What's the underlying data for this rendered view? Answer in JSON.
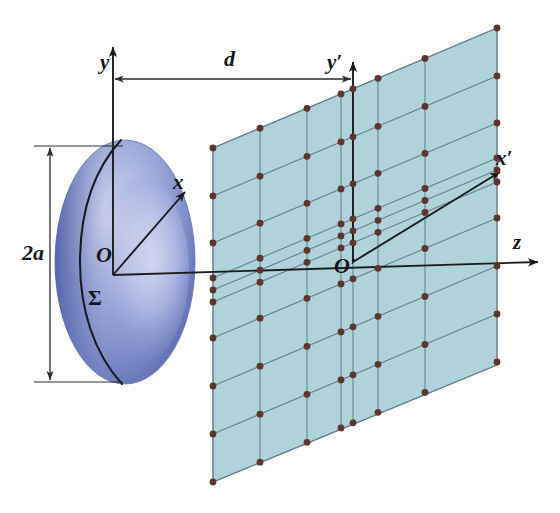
{
  "figure": {
    "background_color": "#fdfdfd"
  },
  "colors": {
    "plane_fill": "#a9ced6",
    "plane_edge": "#5f7f8a",
    "grid_line": "#6e8d96",
    "dot": "#5e3330",
    "axis": "#1b1c20",
    "sphere_dark": "#5c6cae",
    "sphere_mid": "#8e9ad2",
    "sphere_light": "#d6dcf0",
    "sphere_rim": "#4a5aa0",
    "label": "#15161a",
    "dimension_line": "#2a2c31"
  },
  "labels": {
    "y_axis": "y",
    "y_prime_axis": "y′",
    "x_axis": "x",
    "x_prime_axis": "x′",
    "z_axis": "z",
    "origin": "O",
    "origin_prime": "O′",
    "sphere_surface": "Σ",
    "diameter": "2a",
    "distance": "d"
  },
  "geometry": {
    "sphere": {
      "center_x": 125,
      "center_y": 262,
      "radius_x": 70,
      "radius_y": 122,
      "label_O_x": 104,
      "label_O_y": 252,
      "label_sigma_x": 97,
      "label_sigma_y": 296
    },
    "origin": {
      "x": 113,
      "y": 275
    },
    "origin_prime": {
      "x": 353,
      "y": 262
    },
    "plane": {
      "left_x": 213,
      "right_x": 497,
      "top_left_y": 148,
      "top_right_y": 28,
      "bottom_left_y": 482,
      "bottom_right_y": 365,
      "columns": 7,
      "rows": 8,
      "dot_radius": 3.4
    },
    "dimension_2a": {
      "x": 50,
      "top_y": 146,
      "bottom_y": 382,
      "tick_left": 34,
      "tick_right": 120
    },
    "dimension_d": {
      "y": 79,
      "left_x": 113,
      "right_x": 353
    }
  },
  "label_positions": {
    "y": {
      "x": 100,
      "y": 52,
      "size": 21
    },
    "y_prime": {
      "x": 327,
      "y": 52,
      "size": 21
    },
    "x": {
      "x": 173,
      "y": 172,
      "size": 21
    },
    "x_prime": {
      "x": 496,
      "y": 148,
      "size": 21
    },
    "z": {
      "x": 513,
      "y": 232,
      "size": 21
    },
    "O": {
      "x": 96,
      "y": 244,
      "size": 22
    },
    "O_prime": {
      "x": 334,
      "y": 255,
      "size": 22
    },
    "sigma": {
      "x": 88,
      "y": 288,
      "size": 21
    },
    "two_a": {
      "x": 22,
      "y": 242,
      "size": 22
    },
    "d": {
      "x": 224,
      "y": 48,
      "size": 22
    }
  },
  "chart_data": {
    "type": "diagram",
    "annotations": [
      "y",
      "d",
      "y′",
      "x",
      "x′",
      "z",
      "O",
      "O′",
      "Σ",
      "2a"
    ],
    "grid_columns": 7,
    "grid_rows": 8
  }
}
